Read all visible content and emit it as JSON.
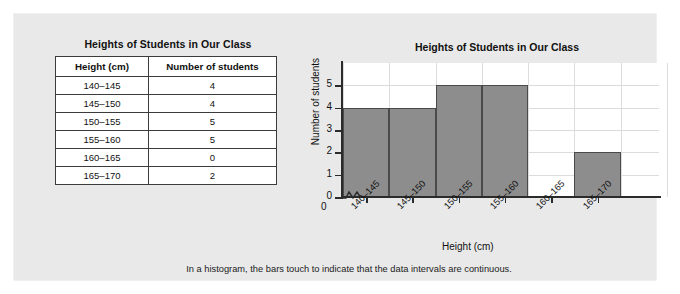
{
  "table": {
    "title": "Heights of Students in Our Class",
    "headers": [
      "Height (cm)",
      "Number of students"
    ],
    "rows": [
      [
        "140–145",
        "4"
      ],
      [
        "145–150",
        "4"
      ],
      [
        "150–155",
        "5"
      ],
      [
        "155–160",
        "5"
      ],
      [
        "160–165",
        "0"
      ],
      [
        "165–170",
        "2"
      ]
    ]
  },
  "caption": "In a histogram, the bars touch to indicate that the data intervals are continuous.",
  "colors": {
    "panel_background": "#e9e9e9",
    "plot_background": "#ffffff",
    "bar_fill": "#8d8d8d",
    "bar_stroke": "#4a4a4a",
    "grid": "#dcdcdc",
    "axis": "#2b2b2b"
  },
  "chart_data": {
    "type": "bar",
    "title": "Heights of Students in Our Class",
    "xlabel": "Height (cm)",
    "ylabel": "Number of students",
    "categories": [
      "140–145",
      "145–150",
      "150–155",
      "155–160",
      "160–165",
      "165–170"
    ],
    "values": [
      4,
      4,
      5,
      5,
      0,
      2
    ],
    "ylim": [
      0,
      6
    ],
    "yticks": [
      0,
      1,
      2,
      3,
      4,
      5
    ],
    "ytick_labels": [
      "0",
      "1",
      "2",
      "3",
      "4",
      "5"
    ],
    "origin_label": "0",
    "grid": true,
    "legend": null,
    "axis_break": "x-axis zigzag break between origin and first interval",
    "bars_touch": true
  }
}
